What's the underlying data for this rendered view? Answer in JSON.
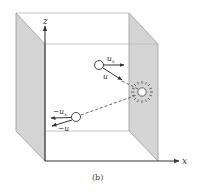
{
  "figure": {
    "caption": "(b)",
    "axes": {
      "z_label": "z",
      "x_label": "x"
    },
    "particles": [
      {
        "name": "incoming-particle",
        "velocity_component_label": "u",
        "velocity_component_sub": "x",
        "velocity_label": "u"
      },
      {
        "name": "reflected-particle",
        "velocity_component_label": "−u",
        "velocity_component_sub": "x",
        "velocity_label": "−u"
      }
    ],
    "collision": "wall-collision-star",
    "colors": {
      "wall_fill": "#d4d4d4",
      "edge": "#9a9a9a",
      "axis": "#333333",
      "background": "#ffffff"
    }
  }
}
